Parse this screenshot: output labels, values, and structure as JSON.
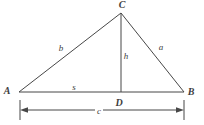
{
  "figure": {
    "background_color": "#ffffff",
    "line_color": "#474747",
    "vertex_labels": {
      "A": "A",
      "B": "B",
      "C": "C",
      "D": "D"
    },
    "measure_labels": {
      "side_b": "b",
      "side_a": "a",
      "altitude_h": "h",
      "segment_s": "s",
      "base_c": "c"
    }
  }
}
